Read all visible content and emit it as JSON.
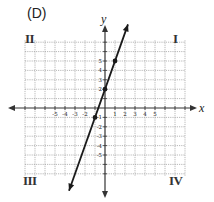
{
  "panel_label": "(D)",
  "quadrants": {
    "I": "I",
    "II": "II",
    "III": "III",
    "IV": "IV"
  },
  "axes": {
    "x_name": "x",
    "y_name": "y"
  },
  "colors": {
    "grid": "#9a9a9a",
    "axis": "#333333",
    "line": "#1a1a1a",
    "text": "#222222"
  },
  "chart_data": {
    "type": "line",
    "title": "(D)",
    "xlabel": "x",
    "ylabel": "y",
    "equation": "y = 3x + 2",
    "xlim": [
      -8,
      8
    ],
    "ylim": [
      -7,
      7
    ],
    "grid": true,
    "x_tick_labels": [
      "-5",
      "-4",
      "-3",
      "-2",
      "1",
      "2",
      "3",
      "4",
      "5"
    ],
    "y_tick_labels": [
      "5",
      "4",
      "3",
      "2",
      "-1",
      "-2",
      "-3",
      "-4",
      "-5"
    ],
    "quadrant_labels": [
      "I",
      "II",
      "III",
      "IV"
    ],
    "series": [
      {
        "name": "line",
        "points": [
          {
            "x": -1,
            "y": -1
          },
          {
            "x": 0,
            "y": 2
          },
          {
            "x": 1,
            "y": 5
          }
        ],
        "arrows_both_ends": true,
        "extent": {
          "from": {
            "x": -3.6,
            "y": -8.8
          },
          "to": {
            "x": 2.3,
            "y": 8.9
          }
        }
      }
    ]
  }
}
